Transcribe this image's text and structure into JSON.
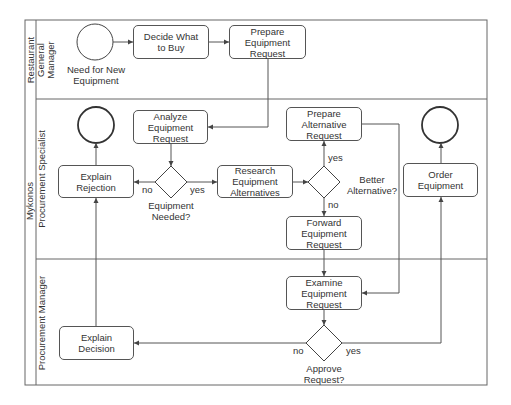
{
  "pool": {
    "label": "Mykonos"
  },
  "lanes": [
    {
      "id": "lane-rgm",
      "label": "Restaurant\nGeneral\nManager",
      "lines": [
        "Restaurant",
        "General",
        "Manager"
      ]
    },
    {
      "id": "lane-ps",
      "label": "Procurement Specialist"
    },
    {
      "id": "lane-pm",
      "label": "Procurement Manager"
    }
  ],
  "events": {
    "start": {
      "label_line1": "Need for New",
      "label_line2": "Equipment"
    }
  },
  "tasks": {
    "decide": {
      "line1": "Decide What",
      "line2": "to Buy",
      "line3": ""
    },
    "prepare": {
      "line1": "Prepare",
      "line2": "Equipment",
      "line3": "Request"
    },
    "analyze": {
      "line1": "Analyze",
      "line2": "Equipment",
      "line3": "Request"
    },
    "rejection": {
      "line1": "Explain",
      "line2": "Rejection",
      "line3": ""
    },
    "research": {
      "line1": "Research",
      "line2": "Equipment",
      "line3": "Alternatives"
    },
    "prepare_alt": {
      "line1": "Prepare",
      "line2": "Alternative",
      "line3": "Request"
    },
    "forward": {
      "line1": "Forward",
      "line2": "Equipment",
      "line3": "Request"
    },
    "order": {
      "line1": "Order",
      "line2": "Equipment",
      "line3": ""
    },
    "examine": {
      "line1": "Examine",
      "line2": "Equipment",
      "line3": "Request"
    },
    "decision": {
      "line1": "Explain",
      "line2": "Decision",
      "line3": ""
    }
  },
  "gateways": {
    "needed": {
      "line1": "Equipment",
      "line2": "Needed?",
      "no": "no",
      "yes": "yes"
    },
    "better": {
      "line1": "Better",
      "line2": "Alternative?",
      "no": "no",
      "yes": "yes"
    },
    "approve": {
      "line1": "Approve",
      "line2": "Request?",
      "no": "no",
      "yes": "yes"
    }
  },
  "colors": {
    "stroke": "#555555",
    "text": "#333333",
    "background": "#ffffff"
  }
}
